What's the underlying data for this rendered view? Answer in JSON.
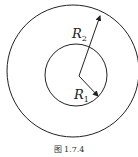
{
  "figure": {
    "caption": "图 1.7.4",
    "labels": {
      "outer_radius": {
        "main": "R",
        "sub": "2"
      },
      "inner_radius": {
        "main": "R",
        "sub": "1"
      }
    },
    "colors": {
      "stroke": "#222222"
    }
  }
}
